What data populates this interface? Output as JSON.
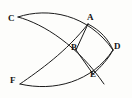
{
  "diagram": {
    "type": "geometric-construction",
    "background_color": "#fdfdfb",
    "stroke_color": "#1b1b1b",
    "canvas": {
      "width": 132,
      "height": 98
    },
    "points": [
      {
        "id": "C",
        "label": "C",
        "x": 18,
        "y": 17,
        "label_x": 8,
        "label_y": 14
      },
      {
        "id": "A",
        "label": "A",
        "x": 88,
        "y": 24,
        "label_x": 87,
        "label_y": 13
      },
      {
        "id": "B",
        "label": "B",
        "x": 76,
        "y": 50,
        "label_x": 71,
        "label_y": 43
      },
      {
        "id": "D",
        "label": "D",
        "x": 113,
        "y": 50,
        "label_x": 114,
        "label_y": 42
      },
      {
        "id": "E",
        "label": "E",
        "x": 93,
        "y": 74,
        "label_x": 90,
        "label_y": 70
      },
      {
        "id": "F",
        "label": "F",
        "x": 20,
        "y": 84,
        "label_x": 10,
        "label_y": 76
      }
    ],
    "edges": [
      {
        "id": "arc-C-D",
        "from": "C",
        "to": "D",
        "kind": "arc",
        "description": "upper long arc from C bowing up and right to D"
      },
      {
        "id": "arc-C-E",
        "from": "C",
        "to": "E",
        "kind": "arc",
        "description": "arc from C descending right through B region to E and beyond"
      },
      {
        "id": "arc-F-A",
        "from": "F",
        "to": "A",
        "kind": "arc",
        "description": "arc from F rising right through B region to A"
      },
      {
        "id": "arc-F-D",
        "from": "F",
        "to": "D",
        "kind": "arc",
        "description": "lower long arc from F bowing down and right to D"
      },
      {
        "id": "seg-A-B",
        "from": "A",
        "to": "B",
        "kind": "segment",
        "description": "straight chord from A to B"
      },
      {
        "id": "seg-B-E",
        "from": "B",
        "to": "E",
        "kind": "segment",
        "description": "straight chord from B to E"
      },
      {
        "id": "arc-A-D",
        "from": "A",
        "to": "D",
        "kind": "arc",
        "description": "short arc from A to D"
      },
      {
        "id": "arc-E-D",
        "from": "E",
        "to": "D",
        "kind": "arc",
        "description": "short arc from E to D"
      }
    ],
    "paths": {
      "arc_C_D": "M 18,17 C 48,7 88,14 113,50",
      "arc_C_E": "M 18,17 C 44,24 78,46 104,84",
      "arc_F_A": "M 20,84 C 40,70 66,52 88,24",
      "arc_F_D": "M 20,84 C 54,92 92,82 113,50",
      "seg_A_B": "M 88,24 L 76,50",
      "seg_B_E": "M 76,50 L 93,74",
      "arc_A_D": "M 88,24 C 100,30 109,40 113,50",
      "arc_E_D": "M 93,74 C 101,67 109,58 113,50"
    }
  }
}
